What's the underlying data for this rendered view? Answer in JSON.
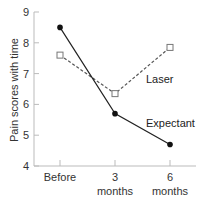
{
  "chart_data": {
    "type": "line",
    "title": "",
    "xlabel": "",
    "ylabel": "Pain scores with time",
    "categories": [
      "Before",
      "3 months",
      "6 months"
    ],
    "category_lines": [
      [
        "Before"
      ],
      [
        "3",
        "months"
      ],
      [
        "6",
        "months"
      ]
    ],
    "ylim": [
      4,
      9
    ],
    "yticks": [
      4,
      5,
      6,
      7,
      8,
      9
    ],
    "grid": false,
    "legend": "inline labels",
    "series": [
      {
        "name": "Laser",
        "values": [
          7.6,
          6.35,
          7.85
        ],
        "style": "dashed",
        "marker": "open-square",
        "color": "#555555"
      },
      {
        "name": "Expectant",
        "values": [
          8.5,
          5.7,
          4.7
        ],
        "style": "solid",
        "marker": "filled-circle",
        "color": "#222222"
      }
    ]
  },
  "labels": {
    "laser": "Laser",
    "expectant": "Expectant"
  },
  "colors": {
    "axis": "#bbbbbb",
    "laser": "#555555",
    "expectant": "#222222"
  }
}
